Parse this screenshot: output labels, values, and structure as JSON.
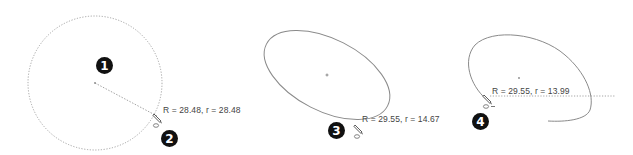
{
  "figure": {
    "colors": {
      "background": "#ffffff",
      "geometry": "#8a8a8a",
      "construction": "#9a9a9a",
      "marker_fill": "#111111",
      "marker_text": "#ffffff",
      "label_text": "#444444"
    },
    "steps": [
      {
        "marker": "1",
        "shape": "dotted-circle-preview"
      },
      {
        "marker": "2",
        "shape": "dotted-circle-preview",
        "dimension_label": "R = 28.48, r = 28.48",
        "cursor_icon": "pencil-ellipse-cursor-icon"
      },
      {
        "marker": "3",
        "shape": "ellipse",
        "dimension_label": "R = 29.55, r = 14.67",
        "cursor_icon": "pencil-ellipse-cursor-icon"
      },
      {
        "marker": "4",
        "shape": "open-ellipse-arc",
        "dimension_label": "R = 29.55, r = 13.99",
        "cursor_icon": "pencil-ellipse-cursor-icon"
      }
    ]
  }
}
